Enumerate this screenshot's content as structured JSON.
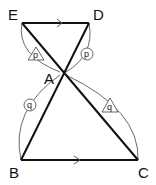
{
  "diagram": {
    "type": "geometry-similar-triangles",
    "points": {
      "E": {
        "label": "E",
        "x": 22,
        "y": 23
      },
      "D": {
        "label": "D",
        "x": 89,
        "y": 23
      },
      "A": {
        "label": "A",
        "x": 63,
        "y": 72
      },
      "B": {
        "label": "B",
        "x": 21,
        "y": 160
      },
      "C": {
        "label": "C",
        "x": 138,
        "y": 160
      }
    },
    "segments": [
      {
        "from": "E",
        "to": "D",
        "parallel_mark": true
      },
      {
        "from": "B",
        "to": "C",
        "parallel_mark": true
      },
      {
        "from": "E",
        "to": "C"
      },
      {
        "from": "D",
        "to": "B"
      }
    ],
    "angle_marks": [
      {
        "label": "p",
        "shape": "triangle",
        "at": "E"
      },
      {
        "label": "p",
        "shape": "circle",
        "at": "D"
      },
      {
        "label": "q",
        "shape": "circle",
        "at": "B"
      },
      {
        "label": "q",
        "shape": "triangle",
        "at": "C"
      }
    ],
    "colors": {
      "line": "#111111",
      "arc": "#444444",
      "arrow": "#555555"
    }
  }
}
